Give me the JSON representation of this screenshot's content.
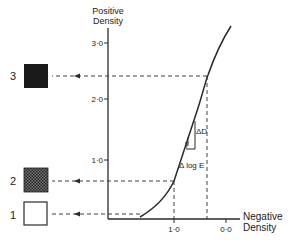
{
  "y_axis": {
    "title_line1": "Positive",
    "title_line2": "Density",
    "ticks": [
      {
        "label": "3·0",
        "y": 43
      },
      {
        "label": "2·0",
        "y": 99
      },
      {
        "label": "1·0",
        "y": 160
      }
    ]
  },
  "x_axis": {
    "title_line1": "Negative",
    "title_line2": "Density",
    "ticks": [
      {
        "label": "1·0",
        "x": 174
      },
      {
        "label": "0·0",
        "x": 226
      }
    ]
  },
  "samples": [
    {
      "label": "3",
      "fill": "#1a1a1a",
      "pattern": "solid"
    },
    {
      "label": "2",
      "fill": "#555555",
      "pattern": "checkered"
    },
    {
      "label": "1",
      "fill": "#ffffff",
      "pattern": "empty"
    }
  ],
  "annotations": {
    "delta_d": "ΔD",
    "gamma": "γ",
    "delta_log_e": "Δ log E"
  },
  "colors": {
    "line": "#2a2a2a",
    "background": "#ffffff"
  }
}
